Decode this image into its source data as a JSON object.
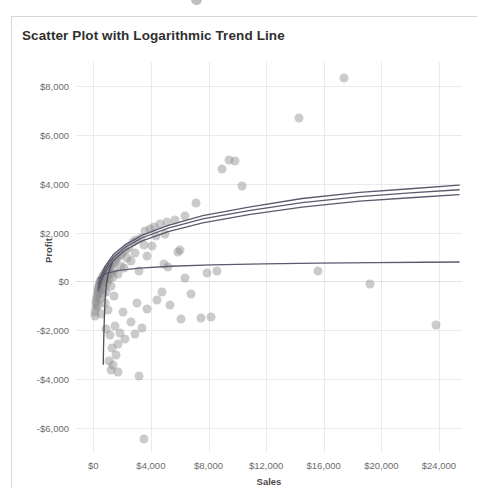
{
  "card": {
    "title": "Scatter Plot with Logarithmic Trend Line"
  },
  "chart_data": {
    "type": "scatter",
    "title": "Scatter Plot with Logarithmic Trend Line",
    "xlabel": "Sales",
    "ylabel": "Profit",
    "xlim": [
      -1200,
      25600
    ],
    "ylim": [
      -7000,
      9000
    ],
    "xticks": [
      0,
      4000,
      8000,
      12000,
      16000,
      20000,
      24000
    ],
    "xticklabels": [
      "$0",
      "$4,000",
      "$8,000",
      "$12,000",
      "$16,000",
      "$20,000",
      "$24,000"
    ],
    "yticks": [
      8000,
      6000,
      4000,
      2000,
      0,
      -2000,
      -4000,
      -6000
    ],
    "yticklabels": [
      "$8,000",
      "$6,000",
      "$4,000",
      "$2,000",
      "$0",
      "-$2,000",
      "-$4,000",
      "-$6,000"
    ],
    "grid": true,
    "legend": "none",
    "zero_reference_line": 0,
    "marker": {
      "color": "#8c8c8c",
      "opacity": 0.45,
      "size": 9
    },
    "points": [
      [
        17400,
        8350
      ],
      [
        14300,
        6700
      ],
      [
        9400,
        5000
      ],
      [
        9850,
        4950
      ],
      [
        8950,
        4600
      ],
      [
        10350,
        3900
      ],
      [
        7150,
        3200
      ],
      [
        6350,
        2700
      ],
      [
        5700,
        2500
      ],
      [
        5150,
        2450
      ],
      [
        4600,
        2350
      ],
      [
        4200,
        2250
      ],
      [
        3950,
        2150
      ],
      [
        3600,
        2050
      ],
      [
        5000,
        1950
      ],
      [
        4350,
        1850
      ],
      [
        3300,
        1800
      ],
      [
        3000,
        1700
      ],
      [
        2750,
        1600
      ],
      [
        3500,
        1500
      ],
      [
        4100,
        1450
      ],
      [
        2450,
        1400
      ],
      [
        2250,
        1300
      ],
      [
        6050,
        1300
      ],
      [
        2050,
        1200
      ],
      [
        2900,
        1150
      ],
      [
        1900,
        1100
      ],
      [
        3750,
        1050
      ],
      [
        1750,
        1000
      ],
      [
        2350,
        950
      ],
      [
        1600,
        900
      ],
      [
        2600,
        850
      ],
      [
        1500,
        800
      ],
      [
        1350,
        750
      ],
      [
        4900,
        720
      ],
      [
        1250,
        700
      ],
      [
        1900,
        650
      ],
      [
        1150,
        600
      ],
      [
        2150,
        560
      ],
      [
        1050,
        520
      ],
      [
        1450,
        480
      ],
      [
        950,
        450
      ],
      [
        3150,
        430
      ],
      [
        880,
        400
      ],
      [
        1250,
        360
      ],
      [
        820,
        330
      ],
      [
        1700,
        300
      ],
      [
        760,
        280
      ],
      [
        1000,
        250
      ],
      [
        700,
        220
      ],
      [
        1350,
        190
      ],
      [
        650,
        170
      ],
      [
        880,
        140
      ],
      [
        600,
        110
      ],
      [
        1100,
        90
      ],
      [
        560,
        70
      ],
      [
        790,
        40
      ],
      [
        520,
        20
      ],
      [
        680,
        -10
      ],
      [
        480,
        -40
      ],
      [
        950,
        -70
      ],
      [
        450,
        -100
      ],
      [
        600,
        -130
      ],
      [
        420,
        -160
      ],
      [
        1200,
        -190
      ],
      [
        390,
        -220
      ],
      [
        740,
        -260
      ],
      [
        360,
        -300
      ],
      [
        520,
        -340
      ],
      [
        330,
        -380
      ],
      [
        900,
        -420
      ],
      [
        300,
        -470
      ],
      [
        640,
        -520
      ],
      [
        270,
        -580
      ],
      [
        1450,
        -620
      ],
      [
        240,
        -680
      ],
      [
        450,
        -740
      ],
      [
        210,
        -800
      ],
      [
        800,
        -870
      ],
      [
        185,
        -940
      ],
      [
        350,
        -1010
      ],
      [
        160,
        -1090
      ],
      [
        1050,
        -1160
      ],
      [
        140,
        -1240
      ],
      [
        560,
        -1320
      ],
      [
        120,
        -1400
      ],
      [
        2050,
        -1250
      ],
      [
        3050,
        -900
      ],
      [
        3700,
        -1150
      ],
      [
        4450,
        -780
      ],
      [
        2600,
        -1650
      ],
      [
        3350,
        -1900
      ],
      [
        1850,
        -2100
      ],
      [
        2200,
        -2350
      ],
      [
        1500,
        -1850
      ],
      [
        1150,
        -2200
      ],
      [
        1700,
        -2550
      ],
      [
        900,
        -1950
      ],
      [
        2900,
        -2150
      ],
      [
        6100,
        -1550
      ],
      [
        7450,
        -1500
      ],
      [
        8200,
        -1450
      ],
      [
        5350,
        -950
      ],
      [
        6800,
        -500
      ],
      [
        7900,
        350
      ],
      [
        8600,
        430
      ],
      [
        5850,
        1200
      ],
      [
        6400,
        150
      ],
      [
        4750,
        -450
      ],
      [
        5200,
        600
      ],
      [
        1300,
        -2750
      ],
      [
        1600,
        -3000
      ],
      [
        1100,
        -3250
      ],
      [
        1400,
        -3450
      ],
      [
        1250,
        -3620
      ],
      [
        1750,
        -3700
      ],
      [
        3200,
        -3900
      ],
      [
        3500,
        -6450
      ],
      [
        23800,
        -1800
      ],
      [
        19200,
        -120
      ],
      [
        15600,
        420
      ]
    ],
    "trend_lines": [
      {
        "name": "log-trend-upper",
        "color": "#5a5a6e",
        "points": [
          [
            340,
            -120
          ],
          [
            800,
            600
          ],
          [
            1400,
            1100
          ],
          [
            2200,
            1500
          ],
          [
            3400,
            1900
          ],
          [
            5200,
            2300
          ],
          [
            7600,
            2700
          ],
          [
            10800,
            3050
          ],
          [
            14500,
            3400
          ],
          [
            18500,
            3650
          ],
          [
            22000,
            3800
          ],
          [
            25400,
            3950
          ]
        ]
      },
      {
        "name": "log-trend-middle",
        "color": "#5a5a6e",
        "points": [
          [
            340,
            -280
          ],
          [
            800,
            480
          ],
          [
            1400,
            980
          ],
          [
            2200,
            1400
          ],
          [
            3400,
            1790
          ],
          [
            5200,
            2180
          ],
          [
            7600,
            2560
          ],
          [
            10800,
            2900
          ],
          [
            14500,
            3230
          ],
          [
            18500,
            3480
          ],
          [
            22000,
            3630
          ],
          [
            25400,
            3760
          ]
        ]
      },
      {
        "name": "log-trend-lower",
        "color": "#5a5a6e",
        "points": [
          [
            340,
            -400
          ],
          [
            800,
            360
          ],
          [
            1400,
            860
          ],
          [
            2200,
            1280
          ],
          [
            3400,
            1660
          ],
          [
            5200,
            2040
          ],
          [
            7600,
            2400
          ],
          [
            10800,
            2740
          ],
          [
            14500,
            3050
          ],
          [
            18500,
            3290
          ],
          [
            22000,
            3430
          ],
          [
            25400,
            3560
          ]
        ]
      },
      {
        "name": "log-trend-flat",
        "color": "#5a5a6e",
        "points": [
          [
            340,
            120
          ],
          [
            900,
            330
          ],
          [
            1800,
            450
          ],
          [
            3200,
            540
          ],
          [
            5400,
            620
          ],
          [
            8200,
            680
          ],
          [
            11800,
            720
          ],
          [
            15600,
            750
          ],
          [
            19600,
            770
          ],
          [
            23000,
            785
          ],
          [
            25400,
            795
          ]
        ]
      },
      {
        "name": "log-trend-steep-drop",
        "color": "#4e4e5e",
        "points": [
          [
            1320,
            760
          ],
          [
            1180,
            560
          ],
          [
            1020,
            260
          ],
          [
            900,
            -180
          ],
          [
            820,
            -760
          ],
          [
            770,
            -1460
          ],
          [
            735,
            -2180
          ],
          [
            710,
            -2800
          ],
          [
            695,
            -3400
          ]
        ]
      }
    ]
  }
}
